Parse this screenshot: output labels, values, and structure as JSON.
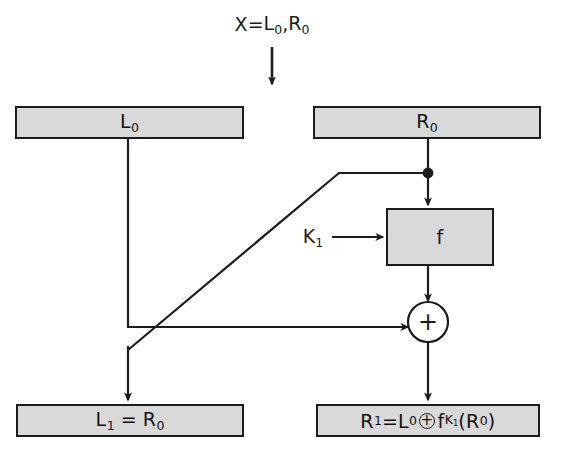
{
  "diagram": {
    "title_expr": {
      "x_label": "X",
      "equals": " = ",
      "left_half": "L",
      "left_sub": "0",
      "comma": ", ",
      "right_half": "R",
      "right_sub": "0"
    },
    "boxes": {
      "left_input": {
        "base": "L",
        "sub": "0"
      },
      "right_input": {
        "base": "R",
        "sub": "0"
      },
      "round_function": {
        "label": "f"
      },
      "left_output": {
        "lhs_base": "L",
        "lhs_sub": "1",
        "equals": " = ",
        "rhs_base": "R",
        "rhs_sub": "0"
      },
      "right_output": {
        "lhs_base": "R",
        "lhs_sub": "1",
        "equals": " = ",
        "term1_base": "L",
        "term1_sub": "0",
        "xor": "+",
        "term2_base": "f",
        "term2_key_base": "K",
        "term2_key_sub": "1",
        "open_paren": "(",
        "arg_base": "R",
        "arg_sub": "0",
        "close_paren": ")"
      }
    },
    "labels": {
      "round_key": {
        "base": "K",
        "sub": "1"
      },
      "xor_operator": "+"
    },
    "colors": {
      "box_fill": "#d9d9d9",
      "stroke": "#1c1c1c",
      "background": "#ffffff"
    }
  }
}
